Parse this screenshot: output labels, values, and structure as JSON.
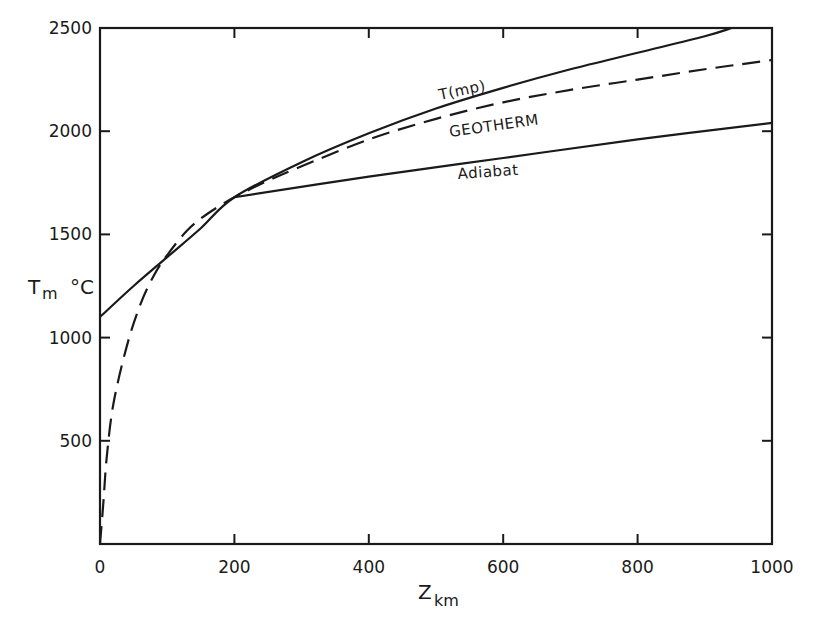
{
  "chart_data": {
    "type": "line",
    "title": "",
    "xlabel": "Z",
    "xlabel_sub": "km",
    "ylabel": "T",
    "ylabel_sub": "m",
    "ylabel_unit": "°C",
    "xlim": [
      0,
      1000
    ],
    "ylim": [
      0,
      2500
    ],
    "x_ticks": [
      0,
      200,
      400,
      600,
      800,
      1000
    ],
    "x_tick_labels": [
      "0",
      "200",
      "400",
      "600",
      "800",
      "1000"
    ],
    "y_ticks": [
      500,
      1000,
      1500,
      2000,
      2500
    ],
    "y_tick_labels": [
      "500",
      "1000",
      "1500",
      "2000",
      "2500"
    ],
    "grid": false,
    "legend": "none (inline curve labels)",
    "series": [
      {
        "name": "T(mp)",
        "label": "T(mp)",
        "style": "solid",
        "x": [
          0,
          50,
          100,
          150,
          200,
          300,
          400,
          500,
          600,
          700,
          800,
          900,
          940
        ],
        "y": [
          1100,
          1250,
          1390,
          1530,
          1680,
          1850,
          1990,
          2110,
          2210,
          2300,
          2380,
          2460,
          2500
        ]
      },
      {
        "name": "GEOTHERM",
        "label": "GEOTHERM",
        "style": "dashed",
        "x": [
          0,
          5,
          10,
          20,
          40,
          60,
          80,
          100,
          130,
          160,
          200,
          250,
          300,
          400,
          500,
          600,
          700,
          800,
          900,
          1000
        ],
        "y": [
          0,
          200,
          420,
          680,
          960,
          1160,
          1300,
          1400,
          1520,
          1600,
          1680,
          1760,
          1830,
          1960,
          2060,
          2140,
          2200,
          2250,
          2300,
          2345
        ]
      },
      {
        "name": "Adiabat",
        "label": "Adiabat",
        "style": "solid",
        "x": [
          200,
          400,
          600,
          800,
          1000
        ],
        "y": [
          1680,
          1780,
          1870,
          1960,
          2040
        ]
      }
    ]
  }
}
